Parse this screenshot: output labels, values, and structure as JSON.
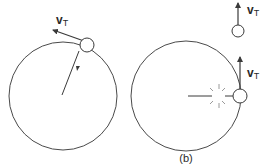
{
  "figure": {
    "left_panel": {
      "velocity_label": "v",
      "velocity_subscript": "T"
    },
    "right_panel": {
      "velocity_label_moving": "v",
      "velocity_subscript_moving": "T",
      "velocity_label_released": "v",
      "velocity_subscript_released": "T",
      "caption": "(b)"
    }
  },
  "colors": {
    "stroke": "#3a3a3a",
    "spark": "#9a9a9a",
    "background": "#ffffff"
  }
}
